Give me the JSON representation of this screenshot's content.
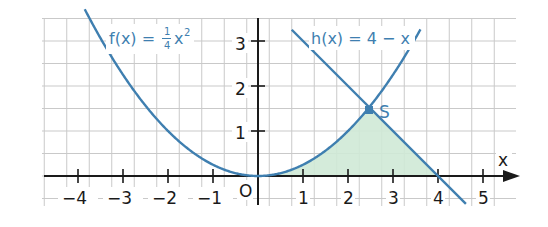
{
  "chart_data": {
    "type": "line",
    "title": "",
    "xlabel": "x",
    "ylabel": "",
    "xlim": [
      -4.75,
      5.6
    ],
    "ylim": [
      -0.5,
      3.5
    ],
    "grid": true,
    "grid_step": 0.5,
    "x_ticks": [
      -4,
      -3,
      -2,
      -1,
      1,
      2,
      3,
      4,
      5
    ],
    "x_tick_labels": [
      "−4",
      "−3",
      "−2",
      "−1",
      "1",
      "2",
      "3",
      "4",
      "5"
    ],
    "y_ticks": [
      1,
      2,
      3
    ],
    "y_tick_labels": [
      "1",
      "2",
      "3"
    ],
    "origin_label": "O",
    "series": [
      {
        "name": "f(x) = 1/4 x²",
        "expression": "0.25*x^2",
        "color": "#3f7fb0",
        "x": [
          -3.8,
          -3,
          -2,
          -1,
          0,
          1,
          2,
          2.47,
          3,
          3.6
        ],
        "values": [
          3.61,
          2.25,
          1.0,
          0.25,
          0,
          0.25,
          1.0,
          1.53,
          2.25,
          3.24
        ]
      },
      {
        "name": "h(x) = 4 − x",
        "expression": "4-x",
        "color": "#3f7fb0",
        "x": [
          0.75,
          2.47,
          4,
          4.6
        ],
        "values": [
          3.25,
          1.53,
          0,
          -0.6
        ]
      }
    ],
    "points": [
      {
        "label": "S",
        "x": 2.47,
        "y": 1.53
      }
    ],
    "shaded_region": {
      "description": "Area between x-axis, f(x) from 0 to S, and h(x) from S to 4",
      "color": "#cfe9d6"
    },
    "annotations": [
      {
        "text": "f(x) = 1/4 x²",
        "series": 0
      },
      {
        "text": "h(x) = 4 − x",
        "series": 1
      }
    ]
  },
  "labels": {
    "f_prefix": "f(x) =",
    "f_num": "1",
    "f_den": "4",
    "f_var": "x",
    "f_exp": "2",
    "h_label": "h(x) = 4 − x",
    "point_s": "S",
    "axis_x": "x",
    "origin": "O",
    "xt_m4": "−4",
    "xt_m3": "−3",
    "xt_m2": "−2",
    "xt_m1": "−1",
    "xt_1": "1",
    "xt_2": "2",
    "xt_3": "3",
    "xt_4": "4",
    "xt_5": "5",
    "yt_1": "1",
    "yt_2": "2",
    "yt_3": "3"
  },
  "colors": {
    "curve": "#3f7fb0",
    "grid": "#c8c8c8",
    "axis": "#1a1a1a",
    "fill": "#cfe9d6"
  }
}
